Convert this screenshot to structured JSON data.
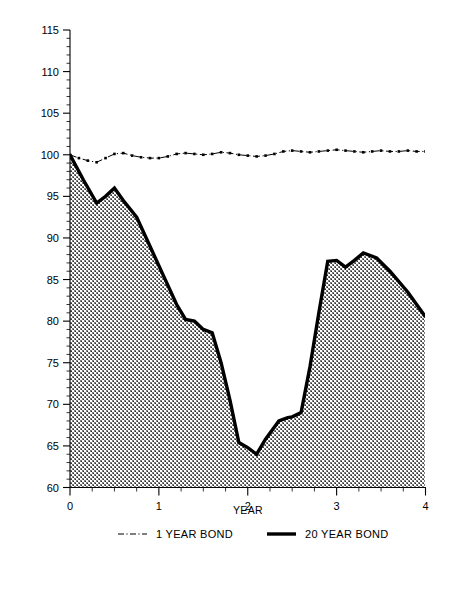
{
  "chart_data": {
    "type": "area",
    "title": "",
    "subtitle": "",
    "xlabel": "YEAR",
    "ylabel": "",
    "xlim": [
      0,
      4
    ],
    "ylim": [
      60,
      115
    ],
    "grid": false,
    "legend_position": "bottom",
    "x_ticks_major": [
      0,
      1,
      2,
      3,
      4
    ],
    "x_tick_labels": [
      "0",
      "1",
      "2",
      "3",
      "4"
    ],
    "x_minor_step": 0.25,
    "y_ticks_major": [
      60,
      65,
      70,
      75,
      80,
      85,
      90,
      95,
      100,
      105,
      110,
      115
    ],
    "y_tick_labels": [
      "60",
      "65",
      "70",
      "75",
      "80",
      "85",
      "90",
      "95",
      "100",
      "105",
      "110",
      "115"
    ],
    "y_minor_step": 1,
    "series": [
      {
        "name": "1 YEAR BOND",
        "style": "dash-dot-with-markers",
        "filled": false,
        "color": "#000000",
        "x": [
          0.0,
          0.1,
          0.2,
          0.3,
          0.4,
          0.5,
          0.6,
          0.7,
          0.8,
          0.9,
          1.0,
          1.1,
          1.2,
          1.3,
          1.4,
          1.5,
          1.6,
          1.7,
          1.8,
          1.9,
          2.0,
          2.1,
          2.2,
          2.3,
          2.4,
          2.5,
          2.6,
          2.7,
          2.8,
          2.9,
          3.0,
          3.1,
          3.2,
          3.3,
          3.4,
          3.5,
          3.6,
          3.7,
          3.8,
          3.9,
          4.0
        ],
        "values": [
          100.0,
          99.6,
          99.3,
          99.1,
          99.6,
          100.1,
          100.2,
          99.9,
          99.7,
          99.6,
          99.6,
          99.8,
          100.1,
          100.2,
          100.1,
          100.0,
          100.1,
          100.3,
          100.2,
          100.0,
          99.9,
          99.8,
          99.9,
          100.1,
          100.4,
          100.5,
          100.4,
          100.3,
          100.4,
          100.5,
          100.6,
          100.5,
          100.4,
          100.3,
          100.4,
          100.5,
          100.4,
          100.4,
          100.5,
          100.4,
          100.4
        ]
      },
      {
        "name": "20 YEAR BOND",
        "style": "thick-solid",
        "filled": true,
        "fill_pattern": "checker-dither-gray",
        "color": "#000000",
        "x": [
          0.0,
          0.15,
          0.3,
          0.4,
          0.5,
          0.6,
          0.75,
          0.9,
          1.05,
          1.2,
          1.3,
          1.4,
          1.5,
          1.6,
          1.7,
          1.8,
          1.9,
          2.0,
          2.1,
          2.2,
          2.35,
          2.45,
          2.5,
          2.6,
          2.7,
          2.8,
          2.9,
          3.0,
          3.1,
          3.2,
          3.3,
          3.45,
          3.6,
          3.8,
          4.0
        ],
        "values": [
          100.0,
          97.0,
          94.2,
          95.0,
          96.0,
          94.5,
          92.5,
          89.0,
          85.5,
          82.0,
          80.2,
          80.0,
          79.0,
          78.6,
          75.0,
          70.5,
          65.4,
          64.8,
          64.0,
          65.8,
          68.0,
          68.4,
          68.5,
          69.0,
          74.5,
          81.0,
          87.2,
          87.3,
          86.5,
          87.3,
          88.2,
          87.6,
          86.0,
          83.5,
          80.5
        ]
      }
    ],
    "legend": [
      {
        "label": "1 YEAR BOND",
        "swatch": "dash-dot-line"
      },
      {
        "label": "20 YEAR BOND",
        "swatch": "thick-solid-line"
      }
    ]
  },
  "colors": {
    "ink": "#000000",
    "background": "#ffffff",
    "fill_gray": "#9a9a9a"
  }
}
